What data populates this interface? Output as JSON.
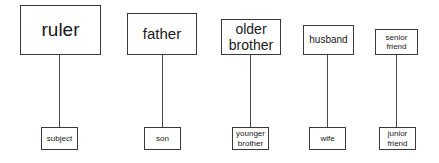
{
  "diagram": {
    "type": "hierarchy-pairs",
    "relationships": [
      {
        "superior": "ruler",
        "subordinate": "subject"
      },
      {
        "superior": "father",
        "subordinate": "son"
      },
      {
        "superior": "older brother",
        "subordinate": "younger brother"
      },
      {
        "superior": "husband",
        "subordinate": "wife"
      },
      {
        "superior": "senior friend",
        "subordinate": "junior friend"
      }
    ]
  },
  "pairs": [
    {
      "top": "ruler",
      "bottom": "subject"
    },
    {
      "top": "father",
      "bottom": "son"
    },
    {
      "top_line1": "older",
      "top_line2": "brother",
      "bottom_line1": "younger",
      "bottom_line2": "brother"
    },
    {
      "top": "husband",
      "bottom": "wife"
    },
    {
      "top_line1": "senior",
      "top_line2": "friend",
      "bottom_line1": "junior",
      "bottom_line2": "friend"
    }
  ]
}
